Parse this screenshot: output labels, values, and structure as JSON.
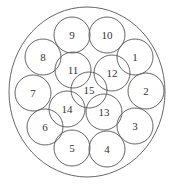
{
  "diagram": {
    "type": "circle-packing",
    "stroke_color": "#555555",
    "text_color": "#333333",
    "outer_circle": {
      "cx": 87,
      "cy": 92,
      "rx": 78,
      "ry": 85
    },
    "circle_radius": 18,
    "circles": [
      {
        "label": "1",
        "cx": 135,
        "cy": 57
      },
      {
        "label": "2",
        "cx": 146,
        "cy": 91
      },
      {
        "label": "3",
        "cx": 135,
        "cy": 126
      },
      {
        "label": "4",
        "cx": 107,
        "cy": 149
      },
      {
        "label": "5",
        "cx": 72,
        "cy": 148
      },
      {
        "label": "6",
        "cx": 45,
        "cy": 127
      },
      {
        "label": "7",
        "cx": 33,
        "cy": 93
      },
      {
        "label": "8",
        "cx": 43,
        "cy": 57
      },
      {
        "label": "9",
        "cx": 72,
        "cy": 35
      },
      {
        "label": "10",
        "cx": 107,
        "cy": 35
      },
      {
        "label": "11",
        "cx": 73,
        "cy": 70
      },
      {
        "label": "12",
        "cx": 112,
        "cy": 73
      },
      {
        "label": "13",
        "cx": 104,
        "cy": 112
      },
      {
        "label": "14",
        "cx": 67,
        "cy": 109
      },
      {
        "label": "15",
        "cx": 89,
        "cy": 90
      }
    ]
  }
}
